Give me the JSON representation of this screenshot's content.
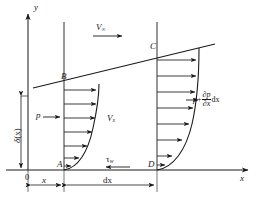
{
  "figure": {
    "name": "boundary-layer-control-volume"
  },
  "axes": {
    "y_label": "y",
    "x_label": "x",
    "origin_label": "0"
  },
  "labels": {
    "free_stream_velocity": "V",
    "free_stream_subscript": "∞",
    "velocity_profile": "V",
    "velocity_profile_subscript": "x",
    "pressure_left": "p",
    "pressure_right_base": "p",
    "pressure_right_plus": "+",
    "pressure_right_num": "∂p",
    "pressure_right_den": "∂x",
    "pressure_right_tail": "dx",
    "wall_shear": "τ",
    "wall_shear_subscript": "w",
    "boundary_thickness_base": "δ",
    "boundary_thickness_arg": "(x)",
    "corner_a": "A",
    "corner_b": "B",
    "corner_c": "C",
    "corner_d": "D",
    "dim_x": "x",
    "dim_dx": "dx"
  },
  "colors": {
    "line": "#1a1a1a",
    "text": "#1a1a1a",
    "background": "#ffffff"
  },
  "geometry": {
    "origin": {
      "x": 28,
      "y": 170
    },
    "station_left_x": 64,
    "station_right_x": 157,
    "top_y": 22,
    "profile_left_arrow_lengths": [
      46,
      45,
      43,
      39,
      32,
      21,
      9
    ],
    "profile_right_arrow_lengths": [
      50,
      49,
      47,
      43,
      36,
      24,
      10
    ]
  }
}
